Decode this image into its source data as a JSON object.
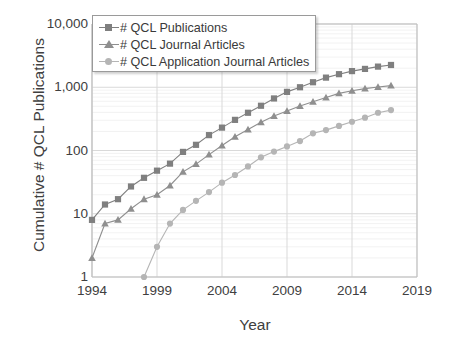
{
  "chart_data": {
    "type": "line",
    "title": "",
    "xlabel": "Year",
    "ylabel": "Cumulative # QCL Publications",
    "yscale": "log",
    "ylim": [
      1,
      10000
    ],
    "xlim": [
      1994,
      2019
    ],
    "grid": true,
    "legend_position": "top-left",
    "y_ticks": [
      "1",
      "10",
      "100",
      "1,000",
      "10,000"
    ],
    "y_tick_values": [
      1,
      10,
      100,
      1000,
      10000
    ],
    "x_ticks": [
      "1994",
      "1999",
      "2004",
      "2009",
      "2014",
      "2019"
    ],
    "x_tick_values": [
      1994,
      1999,
      2004,
      2009,
      2014,
      2019
    ],
    "x": [
      1994,
      1995,
      1996,
      1997,
      1998,
      1999,
      2000,
      2001,
      2002,
      2003,
      2004,
      2005,
      2006,
      2007,
      2008,
      2009,
      2010,
      2011,
      2012,
      2013,
      2014,
      2015,
      2016,
      2017
    ],
    "series": [
      {
        "name": "# QCL Publications",
        "marker": "square",
        "color": "#7f7f7f",
        "values": [
          8,
          14,
          17,
          27,
          37,
          48,
          62,
          95,
          123,
          175,
          230,
          305,
          395,
          510,
          665,
          845,
          1000,
          1200,
          1420,
          1610,
          1800,
          1950,
          2120,
          2250
        ]
      },
      {
        "name": "# QCL Journal Articles",
        "marker": "triangle",
        "color": "#8f8f8f",
        "values": [
          2,
          7,
          8,
          12,
          17,
          20,
          28,
          46,
          61,
          86,
          120,
          165,
          215,
          280,
          350,
          420,
          505,
          590,
          690,
          800,
          880,
          950,
          1010,
          1060
        ]
      },
      {
        "name": "# QCL Application Journal Articles",
        "marker": "circle",
        "color": "#b5b5b5",
        "values": [
          null,
          null,
          null,
          null,
          1,
          3,
          7,
          11.5,
          16,
          22,
          31,
          41,
          56,
          78,
          96,
          116,
          141,
          187,
          210,
          245,
          285,
          330,
          395,
          435
        ]
      }
    ]
  },
  "colors": {
    "series1": "#7f7f7f",
    "series2": "#8f8f8f",
    "series3": "#b5b5b5",
    "axis": "#bfbfbf",
    "grid_major": "#d9d9d9",
    "grid_minor": "#efefef",
    "text": "#404040",
    "legend_border": "#9a9a9a"
  }
}
